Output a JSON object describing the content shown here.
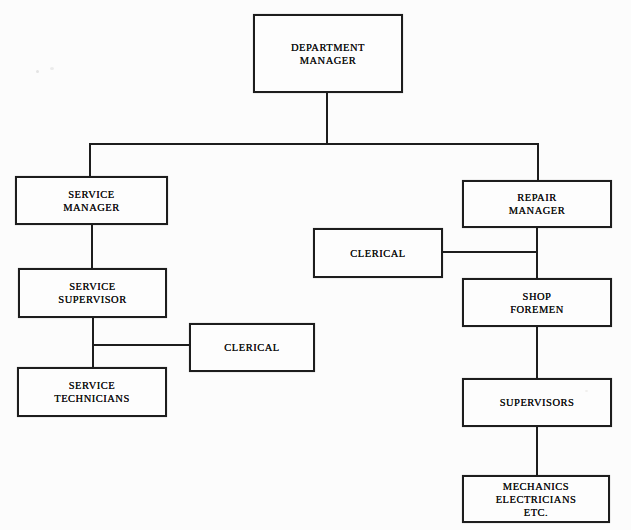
{
  "diagram": {
    "type": "org-chart",
    "nodes": [
      {
        "id": "department-manager",
        "label": "DEPARTMENT\nMANAGER"
      },
      {
        "id": "service-manager",
        "label": "SERVICE\nMANAGER"
      },
      {
        "id": "service-supervisor",
        "label": "SERVICE\nSUPERVISOR"
      },
      {
        "id": "clerical-service",
        "label": "CLERICAL"
      },
      {
        "id": "service-technicians",
        "label": "SERVICE\nTECHNICIANS"
      },
      {
        "id": "repair-manager",
        "label": "REPAIR\nMANAGER"
      },
      {
        "id": "clerical-repair",
        "label": "CLERICAL"
      },
      {
        "id": "shop-foremen",
        "label": "SHOP\nFOREMEN"
      },
      {
        "id": "supervisors",
        "label": "SUPERVISORS"
      },
      {
        "id": "mechanics-electricians",
        "label": "MECHANICS\nELECTRICIANS\nETC."
      }
    ],
    "edges": [
      {
        "from": "department-manager",
        "to": "service-manager"
      },
      {
        "from": "department-manager",
        "to": "repair-manager"
      },
      {
        "from": "service-manager",
        "to": "service-supervisor"
      },
      {
        "from": "service-supervisor",
        "to": "service-technicians"
      },
      {
        "from": "service-supervisor",
        "to": "clerical-service",
        "style": "staff-side"
      },
      {
        "from": "repair-manager",
        "to": "clerical-repair",
        "style": "staff-side"
      },
      {
        "from": "repair-manager",
        "to": "shop-foremen"
      },
      {
        "from": "shop-foremen",
        "to": "supervisors"
      },
      {
        "from": "supervisors",
        "to": "mechanics-electricians"
      }
    ],
    "colors": {
      "line": "#1d1d1d",
      "text": "#131313",
      "paper": "#fcfcfc",
      "box_fill": "#fdfdfd"
    }
  }
}
